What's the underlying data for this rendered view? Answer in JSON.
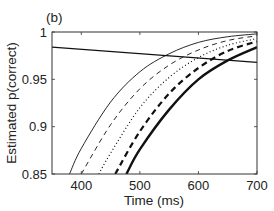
{
  "panel_label": "(b)",
  "chart_data": {
    "type": "line",
    "title": "(b)",
    "xlabel": "Time (ms)",
    "ylabel": "Estimated p(correct)",
    "xlim": [
      350,
      700
    ],
    "ylim": [
      0.85,
      1.0
    ],
    "xticks": [
      400,
      500,
      600,
      700
    ],
    "xtick_labels": [
      "400",
      "500",
      "600",
      "700"
    ],
    "yticks": [
      0.85,
      0.9,
      0.95,
      1.0
    ],
    "ytick_labels": [
      "0.85",
      "0.9",
      "0.95",
      "1"
    ],
    "grid": false,
    "legend": null,
    "series": [
      {
        "name": "thin-solid",
        "style": "solid",
        "width": 0.9,
        "x": [
          380,
          400,
          450,
          500,
          550,
          600,
          650,
          700
        ],
        "y": [
          0.85,
          0.877,
          0.926,
          0.958,
          0.977,
          0.989,
          0.995,
          0.998
        ]
      },
      {
        "name": "thin-dashed",
        "style": "dashed",
        "width": 0.9,
        "x": [
          400,
          450,
          500,
          550,
          600,
          650,
          700
        ],
        "y": [
          0.85,
          0.902,
          0.94,
          0.965,
          0.981,
          0.991,
          0.996
        ]
      },
      {
        "name": "dotted",
        "style": "dotted",
        "width": 1.2,
        "x": [
          430,
          450,
          500,
          550,
          600,
          650,
          700
        ],
        "y": [
          0.85,
          0.872,
          0.92,
          0.952,
          0.973,
          0.986,
          0.993
        ]
      },
      {
        "name": "thick-dashed",
        "style": "dashed",
        "width": 2.2,
        "x": [
          458,
          500,
          550,
          600,
          650,
          700
        ],
        "y": [
          0.85,
          0.895,
          0.935,
          0.962,
          0.98,
          0.99
        ]
      },
      {
        "name": "thick-solid",
        "style": "solid",
        "width": 2.4,
        "x": [
          477,
          500,
          550,
          600,
          650,
          700
        ],
        "y": [
          0.85,
          0.876,
          0.918,
          0.95,
          0.97,
          0.984
        ]
      },
      {
        "name": "decreasing-line",
        "style": "solid",
        "width": 1.3,
        "x": [
          350,
          700
        ],
        "y": [
          0.984,
          0.968
        ]
      }
    ]
  }
}
